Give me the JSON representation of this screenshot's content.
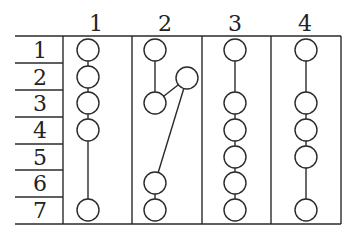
{
  "diagram": {
    "column_headers": [
      "1",
      "2",
      "3",
      "4"
    ],
    "row_labels": [
      "1",
      "2",
      "3",
      "4",
      "5",
      "6",
      "7"
    ],
    "columns": [
      {
        "header": "1",
        "nodes": [
          {
            "id": "a",
            "row": 1,
            "lane": 0
          },
          {
            "id": "b",
            "row": 2,
            "lane": 0
          },
          {
            "id": "c",
            "row": 3,
            "lane": 0
          },
          {
            "id": "d",
            "row": 4,
            "lane": 0
          },
          {
            "id": "e",
            "row": 7,
            "lane": 0
          }
        ],
        "edges": [
          [
            "a",
            "b"
          ],
          [
            "b",
            "c"
          ],
          [
            "c",
            "d"
          ],
          [
            "d",
            "e"
          ]
        ]
      },
      {
        "header": "2",
        "nodes": [
          {
            "id": "a",
            "row": 1,
            "lane": 0
          },
          {
            "id": "x",
            "row": 2,
            "lane": 1
          },
          {
            "id": "b",
            "row": 3,
            "lane": 0
          },
          {
            "id": "c",
            "row": 6,
            "lane": 0
          },
          {
            "id": "d",
            "row": 7,
            "lane": 0
          }
        ],
        "edges": [
          [
            "a",
            "b"
          ],
          [
            "b",
            "x"
          ],
          [
            "x",
            "c"
          ],
          [
            "c",
            "d"
          ]
        ]
      },
      {
        "header": "3",
        "nodes": [
          {
            "id": "a",
            "row": 1,
            "lane": 0
          },
          {
            "id": "b",
            "row": 3,
            "lane": 0
          },
          {
            "id": "c",
            "row": 4,
            "lane": 0
          },
          {
            "id": "d",
            "row": 5,
            "lane": 0
          },
          {
            "id": "e",
            "row": 6,
            "lane": 0
          },
          {
            "id": "f",
            "row": 7,
            "lane": 0
          }
        ],
        "edges": [
          [
            "a",
            "b"
          ],
          [
            "b",
            "c"
          ],
          [
            "c",
            "d"
          ],
          [
            "d",
            "e"
          ],
          [
            "e",
            "f"
          ]
        ]
      },
      {
        "header": "4",
        "nodes": [
          {
            "id": "a",
            "row": 1,
            "lane": 0
          },
          {
            "id": "b",
            "row": 3,
            "lane": 0
          },
          {
            "id": "c",
            "row": 4,
            "lane": 0
          },
          {
            "id": "d",
            "row": 5,
            "lane": 0
          },
          {
            "id": "e",
            "row": 7,
            "lane": 0
          }
        ],
        "edges": [
          [
            "a",
            "b"
          ],
          [
            "b",
            "c"
          ],
          [
            "c",
            "d"
          ],
          [
            "d",
            "e"
          ]
        ]
      }
    ]
  }
}
